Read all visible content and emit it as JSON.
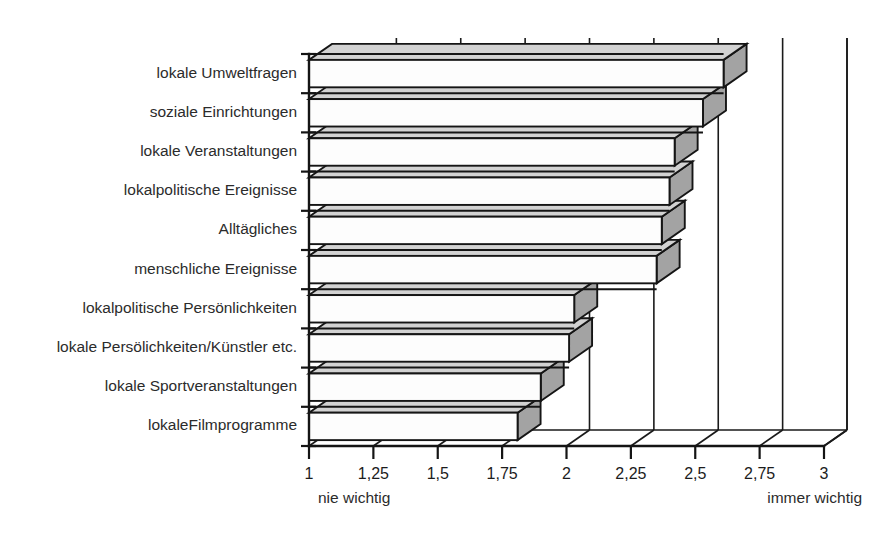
{
  "figure": {
    "background_color": "#ffffff",
    "bar_front_color": "#fdfdfd",
    "bar_side_color": "#a3a3a3",
    "bar_top_color": "#d2d2d2",
    "line_color": "#151515"
  },
  "axis": {
    "left_anchor_label": "nie wichtig",
    "right_anchor_label": "immer wichtig",
    "tick_labels": [
      "1",
      "1,25",
      "1,5",
      "1,75",
      "2",
      "2,25",
      "2,5",
      "2,75",
      "3"
    ],
    "tick_values": [
      1,
      1.25,
      1.5,
      1.75,
      2,
      2.25,
      2.5,
      2.75,
      3
    ]
  },
  "chart_data": {
    "type": "bar",
    "orientation": "horizontal",
    "style": "3d-isometric",
    "title": "",
    "subtitle": "",
    "xlabel": "",
    "ylabel": "",
    "xlim": [
      1,
      3
    ],
    "grid": true,
    "legend": null,
    "decimal_separator": ",",
    "scale_anchors": {
      "min": "nie wichtig",
      "max": "immer wichtig"
    },
    "categories": [
      "lokale Umweltfragen",
      "soziale Einrichtungen",
      "lokale Veranstaltungen",
      "lokalpolitische Ereignisse",
      "Alltägliches",
      "menschliche Ereignisse",
      "lokalpolitische Persönlichkeiten",
      "lokale Persölichkeiten/Künstler etc.",
      "lokale Sportveranstaltungen",
      "lokaleFilmprogramme"
    ],
    "values": [
      2.61,
      2.53,
      2.42,
      2.4,
      2.37,
      2.35,
      2.03,
      2.01,
      1.9,
      1.81
    ],
    "tick_labels": [
      "1",
      "1,25",
      "1,5",
      "1,75",
      "2",
      "2,25",
      "2,5",
      "2,75",
      "3"
    ],
    "ticks": [
      1,
      1.25,
      1.5,
      1.75,
      2,
      2.25,
      2.5,
      2.75,
      3
    ]
  }
}
